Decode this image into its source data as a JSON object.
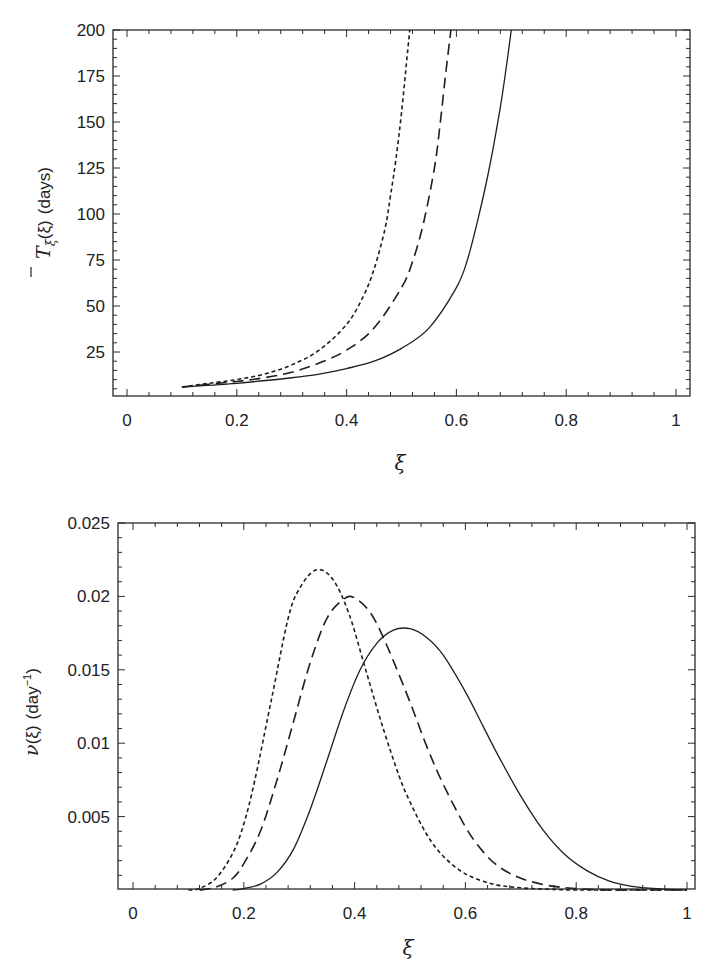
{
  "chart_data": [
    {
      "type": "line",
      "panel": "top",
      "title": "",
      "xlabel": "ξ",
      "ylabel": "T̄_ξ(ξ) (days)",
      "ylabel_parts": {
        "symbol": "T",
        "sub": "ξ",
        "arg": "(ξ)",
        "unit": "(days)"
      },
      "xlim": [
        0,
        1
      ],
      "ylim": [
        0,
        200
      ],
      "x_ticks": [
        "0",
        "0.2",
        "0.4",
        "0.6",
        "0.8",
        "1"
      ],
      "x_tick_values": [
        0,
        0.2,
        0.4,
        0.6,
        0.8,
        1
      ],
      "y_ticks": [
        "25",
        "50",
        "75",
        "100",
        "125",
        "150",
        "175",
        "200"
      ],
      "y_tick_values": [
        25,
        50,
        75,
        100,
        125,
        150,
        175,
        200
      ],
      "grid": false,
      "legend": null,
      "series": [
        {
          "name": "short-dashed",
          "style": "short-dash",
          "x": [
            0.1,
            0.15,
            0.2,
            0.25,
            0.3,
            0.35,
            0.4,
            0.43,
            0.45,
            0.47,
            0.48,
            0.49,
            0.5,
            0.51,
            0.515
          ],
          "y": [
            6,
            8,
            10,
            13,
            18,
            26,
            40,
            55,
            70,
            92,
            110,
            130,
            155,
            185,
            200
          ]
        },
        {
          "name": "long-dashed",
          "style": "long-dash",
          "x": [
            0.1,
            0.15,
            0.2,
            0.25,
            0.3,
            0.35,
            0.4,
            0.45,
            0.5,
            0.52,
            0.54,
            0.56,
            0.57,
            0.58,
            0.59
          ],
          "y": [
            6,
            7.5,
            9,
            11,
            14,
            19,
            26,
            38,
            60,
            74,
            95,
            125,
            148,
            175,
            200
          ]
        },
        {
          "name": "solid",
          "style": "solid",
          "x": [
            0.1,
            0.2,
            0.3,
            0.35,
            0.4,
            0.45,
            0.5,
            0.55,
            0.6,
            0.62,
            0.64,
            0.66,
            0.68,
            0.69,
            0.7
          ],
          "y": [
            6,
            8,
            11,
            13,
            16,
            20,
            27,
            38,
            60,
            75,
            98,
            125,
            158,
            178,
            200
          ]
        }
      ]
    },
    {
      "type": "line",
      "panel": "bottom",
      "title": "",
      "xlabel": "ξ",
      "ylabel": "ν(ξ) (day⁻¹)",
      "ylabel_parts": {
        "symbol": "ν",
        "arg": "(ξ)",
        "unit_base": "(day",
        "unit_sup": "−1",
        "unit_close": ")"
      },
      "xlim": [
        0,
        1
      ],
      "ylim": [
        0,
        0.025
      ],
      "x_ticks": [
        "0",
        "0.2",
        "0.4",
        "0.6",
        "0.8",
        "1"
      ],
      "x_tick_values": [
        0,
        0.2,
        0.4,
        0.6,
        0.8,
        1
      ],
      "y_ticks": [
        "0.005",
        "0.01",
        "0.015",
        "0.02",
        "0.025"
      ],
      "y_tick_values": [
        0.005,
        0.01,
        0.015,
        0.02,
        0.025
      ],
      "grid": false,
      "legend": null,
      "series": [
        {
          "name": "short-dashed",
          "style": "short-dash",
          "x": [
            0.1,
            0.12,
            0.15,
            0.18,
            0.2,
            0.22,
            0.25,
            0.28,
            0.3,
            0.33,
            0.36,
            0.39,
            0.42,
            0.45,
            0.48,
            0.5,
            0.53,
            0.56,
            0.6,
            0.65,
            0.7,
            0.75,
            0.8,
            0.9,
            1.0
          ],
          "y": [
            0,
            0.0001,
            0.0008,
            0.0025,
            0.0045,
            0.0075,
            0.013,
            0.0185,
            0.0205,
            0.0218,
            0.0212,
            0.0188,
            0.015,
            0.0112,
            0.0078,
            0.006,
            0.0038,
            0.0023,
            0.0011,
            0.0004,
            0.00015,
            5e-05,
            0,
            0,
            0
          ]
        },
        {
          "name": "long-dashed",
          "style": "long-dash",
          "x": [
            0.12,
            0.15,
            0.18,
            0.2,
            0.23,
            0.26,
            0.29,
            0.32,
            0.35,
            0.38,
            0.4,
            0.43,
            0.46,
            0.5,
            0.53,
            0.56,
            0.6,
            0.63,
            0.66,
            0.7,
            0.75,
            0.8,
            0.85,
            0.9,
            1.0
          ],
          "y": [
            0,
            0.0002,
            0.0008,
            0.0018,
            0.004,
            0.0075,
            0.0115,
            0.0155,
            0.0185,
            0.0198,
            0.0199,
            0.0188,
            0.0165,
            0.0128,
            0.0098,
            0.0072,
            0.0043,
            0.0027,
            0.0016,
            0.0008,
            0.0003,
            0.0001,
            0,
            0,
            0
          ]
        },
        {
          "name": "solid",
          "style": "solid",
          "x": [
            0.18,
            0.2,
            0.23,
            0.26,
            0.29,
            0.32,
            0.35,
            0.38,
            0.41,
            0.44,
            0.47,
            0.5,
            0.53,
            0.56,
            0.6,
            0.63,
            0.66,
            0.7,
            0.74,
            0.78,
            0.82,
            0.86,
            0.9,
            0.95,
            1.0
          ],
          "y": [
            0,
            0.0001,
            0.0004,
            0.0012,
            0.0028,
            0.0055,
            0.0088,
            0.0122,
            0.015,
            0.0168,
            0.0177,
            0.0178,
            0.0172,
            0.016,
            0.0135,
            0.0113,
            0.0091,
            0.0064,
            0.0041,
            0.0024,
            0.0013,
            0.0006,
            0.00025,
            8e-05,
            0
          ]
        }
      ]
    }
  ]
}
